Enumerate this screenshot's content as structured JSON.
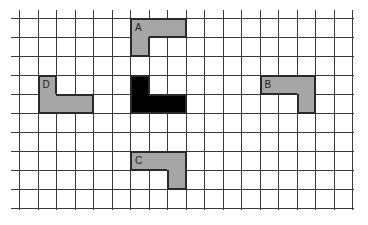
{
  "diagram": {
    "type": "grid-shapes",
    "grid": {
      "origin_x": 19,
      "origin_y": 18,
      "cell_w": 18.5,
      "cell_h": 19,
      "cols": 18,
      "rows": 10,
      "line_color": "#3a3a3a",
      "extend_left": 8
    },
    "colors": {
      "gray": "#a6a6a6",
      "black": "#000000",
      "outline": "#2a2a2a"
    },
    "shapes": [
      {
        "id": "A",
        "label": "A",
        "fill": "gray",
        "cells": [
          [
            6,
            0
          ],
          [
            7,
            0
          ],
          [
            8,
            0
          ],
          [
            6,
            1
          ]
        ],
        "label_cell": [
          6,
          0
        ]
      },
      {
        "id": "black",
        "label": "",
        "fill": "black",
        "cells": [
          [
            6,
            3
          ],
          [
            6,
            4
          ],
          [
            7,
            4
          ],
          [
            8,
            4
          ]
        ],
        "label_cell": null
      },
      {
        "id": "D",
        "label": "D",
        "fill": "gray",
        "cells": [
          [
            1,
            3
          ],
          [
            1,
            4
          ],
          [
            2,
            4
          ],
          [
            3,
            4
          ]
        ],
        "label_cell": [
          1,
          3
        ]
      },
      {
        "id": "B",
        "label": "B",
        "fill": "gray",
        "cells": [
          [
            13,
            3
          ],
          [
            14,
            3
          ],
          [
            15,
            3
          ],
          [
            15,
            4
          ]
        ],
        "label_cell": [
          13,
          3
        ]
      },
      {
        "id": "C",
        "label": "C",
        "fill": "gray",
        "cells": [
          [
            6,
            7
          ],
          [
            7,
            7
          ],
          [
            8,
            7
          ],
          [
            8,
            8
          ]
        ],
        "label_cell": [
          6,
          7
        ]
      }
    ]
  }
}
